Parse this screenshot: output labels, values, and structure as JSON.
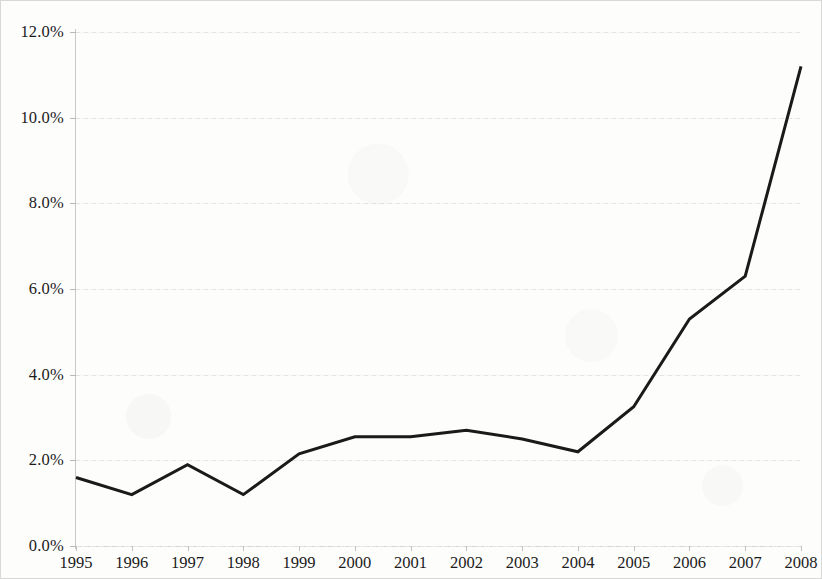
{
  "chart_data": {
    "type": "line",
    "title": "",
    "subtitle": "",
    "xlabel": "",
    "ylabel": "",
    "categories": [
      "1995",
      "1996",
      "1997",
      "1998",
      "1999",
      "2000",
      "2001",
      "2002",
      "2003",
      "2004",
      "2005",
      "2006",
      "2007",
      "2008"
    ],
    "values": [
      1.6,
      1.2,
      1.9,
      1.2,
      2.15,
      2.55,
      2.55,
      2.7,
      2.5,
      2.2,
      3.25,
      5.3,
      6.3,
      11.2
    ],
    "series": [
      {
        "name": "",
        "values": [
          1.6,
          1.2,
          1.9,
          1.2,
          2.15,
          2.55,
          2.55,
          2.7,
          2.5,
          2.2,
          3.25,
          5.3,
          6.3,
          11.2
        ]
      }
    ],
    "ylim": [
      0,
      12
    ],
    "ytick_values": [
      0,
      2,
      4,
      6,
      8,
      10,
      12
    ],
    "ytick_labels": [
      "0.0%",
      "2.0%",
      "4.0%",
      "6.0%",
      "8.0%",
      "10.0%",
      "12.0%"
    ],
    "xtick_labels": [
      "1995",
      "1996",
      "1997",
      "1998",
      "1999",
      "2000",
      "2001",
      "2002",
      "2003",
      "2004",
      "2005",
      "2006",
      "2007",
      "2008"
    ],
    "grid": true,
    "grid_axis": "y",
    "legend": false,
    "legend_position": "none",
    "annotations": [],
    "colors": {
      "line": "#1a1a1a",
      "background": "#fdfdfc",
      "gridline": "#e3e3e0",
      "axis": "#c9c9c5",
      "text": "#1b1b1b",
      "border": "#d8d8d4"
    },
    "line_width_px": 3
  }
}
